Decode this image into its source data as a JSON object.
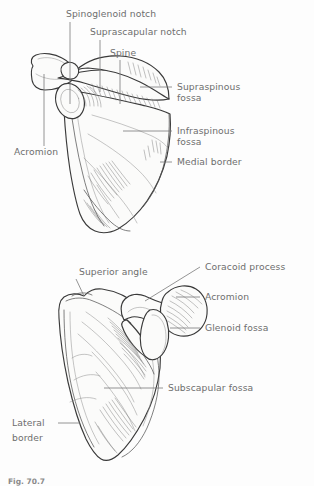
{
  "figure": {
    "caption": "Fig. 70.7",
    "colors": {
      "background": "#fdfdfd",
      "label_text": "#6e6e6e",
      "leader_line": "#7a7a7a",
      "bone_outline": "#3a3a3a",
      "bone_fill": "#fbfbfa",
      "hatching": "#6d6d6d"
    }
  },
  "views": [
    {
      "name": "posterior-view",
      "description": "Posterior (dorsal) view of the right scapula",
      "labels": [
        {
          "id": "spinoglenoid-notch",
          "text": "Spinoglenoid notch",
          "anchor": "start",
          "x": 66,
          "y": 17,
          "leader": {
            "type": "vertical",
            "x1": 70,
            "y1": 22,
            "x2": 70,
            "y2": 104
          }
        },
        {
          "id": "suprascapular-notch",
          "text": "Suprascapular notch",
          "anchor": "start",
          "x": 90,
          "y": 35,
          "leader": {
            "type": "vertical",
            "x1": 100,
            "y1": 40,
            "x2": 100,
            "y2": 92
          }
        },
        {
          "id": "spine",
          "text": "Spine",
          "anchor": "start",
          "x": 110,
          "y": 56,
          "leader": {
            "type": "vertical",
            "x1": 120,
            "y1": 60,
            "x2": 120,
            "y2": 104
          }
        },
        {
          "id": "supraspinous-fossa",
          "text": "Supraspinous",
          "anchor": "start",
          "x": 177,
          "y": 90,
          "text2": "fossa",
          "x2": 177,
          "y2": 101,
          "leader": {
            "type": "horizontal",
            "x1": 140,
            "y1": 87,
            "x2": 172,
            "y2": 87
          }
        },
        {
          "id": "infraspinous-fossa",
          "text": "Infraspinous",
          "anchor": "start",
          "x": 177,
          "y": 134,
          "text2": "fossa",
          "x2": 177,
          "y2": 145,
          "leader": {
            "type": "horizontal",
            "x1": 123,
            "y1": 131,
            "x2": 172,
            "y2": 131
          }
        },
        {
          "id": "medial-border",
          "text": "Medial border",
          "anchor": "start",
          "x": 177,
          "y": 165,
          "leader": {
            "type": "horizontal",
            "x1": 160,
            "y1": 162,
            "x2": 172,
            "y2": 162
          }
        },
        {
          "id": "acromion",
          "text": "Acromion",
          "anchor": "start",
          "x": 14,
          "y": 155,
          "leader": {
            "type": "vertical",
            "x1": 44,
            "y1": 74,
            "x2": 44,
            "y2": 146
          }
        }
      ]
    },
    {
      "name": "anterior-costal-view",
      "description": "Anterior (costal) view of the right scapula",
      "labels": [
        {
          "id": "superior-angle",
          "text": "Superior angle",
          "anchor": "start",
          "x": 79,
          "y": 275,
          "leader": {
            "type": "diagonal",
            "x1": 76,
            "y1": 279,
            "x2": 84,
            "y2": 296
          }
        },
        {
          "id": "coracoid-process",
          "text": "Coracoid process",
          "anchor": "start",
          "x": 205,
          "y": 270,
          "leader": {
            "type": "diagonal",
            "x1": 145,
            "y1": 301,
            "x2": 200,
            "y2": 267
          }
        },
        {
          "id": "acromion-2",
          "text": "Acromion",
          "anchor": "start",
          "x": 205,
          "y": 300,
          "leader": {
            "type": "horizontal",
            "x1": 176,
            "y1": 297,
            "x2": 200,
            "y2": 297
          }
        },
        {
          "id": "glenoid-fossa",
          "text": "Glenoid fossa",
          "anchor": "start",
          "x": 205,
          "y": 331,
          "leader": {
            "type": "horizontal",
            "x1": 170,
            "y1": 328,
            "x2": 200,
            "y2": 328
          }
        },
        {
          "id": "subscapular-fossa",
          "text": "Subscapular fossa",
          "anchor": "start",
          "x": 168,
          "y": 391,
          "leader": {
            "type": "horizontal",
            "x1": 104,
            "y1": 388,
            "x2": 163,
            "y2": 388
          }
        },
        {
          "id": "lateral-border",
          "text": "Lateral",
          "anchor": "start",
          "x": 12,
          "y": 426,
          "text2": "border",
          "x2": 12,
          "y2": 441,
          "leader": {
            "type": "horizontal",
            "x1": 58,
            "y1": 423,
            "x2": 80,
            "y2": 423
          }
        }
      ]
    }
  ]
}
